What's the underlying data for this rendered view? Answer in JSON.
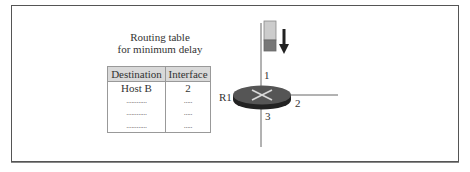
{
  "diagram": {
    "title_line1": "Routing table",
    "title_line2": "for minimum delay",
    "table": {
      "headers": [
        "Destination",
        "Interface"
      ],
      "rows": [
        [
          "Host B",
          "2"
        ],
        [
          "............",
          "....."
        ],
        [
          "............",
          "....."
        ],
        [
          "............",
          "....."
        ]
      ]
    },
    "router": {
      "name": "R1",
      "interfaces": [
        "1",
        "2",
        "3"
      ],
      "colors": {
        "top": "#555555",
        "side": "#222222",
        "cross": "#d8d8d8"
      }
    },
    "packet": {
      "colors": {
        "top": "#cccccc",
        "bottom": "#777777"
      },
      "direction": "down"
    }
  }
}
